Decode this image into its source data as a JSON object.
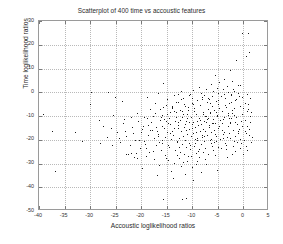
{
  "chart_data": {
    "type": "scatter",
    "title": "Scatterplot of 400 time vs accoustic features",
    "xlabel": "Accoustic loglikelihood ratios",
    "ylabel": "Time loglikelihood ratios",
    "xlim": [
      -40,
      5
    ],
    "ylim": [
      -50,
      30
    ],
    "xticks": [
      -40,
      -35,
      -30,
      -25,
      -20,
      -15,
      -10,
      -5,
      0,
      5
    ],
    "xtick_labels": [
      "-40",
      "-35",
      "-30",
      "-25",
      "-20",
      "-15",
      "-10",
      "-5",
      "0",
      "5"
    ],
    "yticks": [
      -50,
      -40,
      -30,
      -20,
      -10,
      0,
      10,
      20,
      30
    ],
    "ytick_labels": [
      "-50",
      "-40",
      "-30",
      "-20",
      "-10",
      "0",
      "10",
      "20",
      "30"
    ],
    "grid": true,
    "legend": null,
    "marker": "dot",
    "marker_color": "#1a1a1a",
    "n_points": 400,
    "points": [
      [
        -0.3,
        24.8
      ],
      [
        0.9,
        24.9
      ],
      [
        1.1,
        16.8
      ],
      [
        0.5,
        15.1
      ],
      [
        -1.4,
        13.4
      ],
      [
        -2.6,
        9.2
      ],
      [
        -5.6,
        7.4
      ],
      [
        -3.9,
        5.6
      ],
      [
        -2.3,
        4.9
      ],
      [
        -4.7,
        4.2
      ],
      [
        -15.8,
        4.1
      ],
      [
        -6.3,
        3.3
      ],
      [
        -1.0,
        3.2
      ],
      [
        -0.6,
        2.9
      ],
      [
        -3.3,
        2.6
      ],
      [
        -8.7,
        2.1
      ],
      [
        -5.2,
        1.9
      ],
      [
        -2.0,
        1.6
      ],
      [
        -7.4,
        1.4
      ],
      [
        -4.1,
        1.2
      ],
      [
        -9.8,
        0.9
      ],
      [
        -1.8,
        0.7
      ],
      [
        -6.0,
        0.5
      ],
      [
        -12.3,
        0.4
      ],
      [
        -3.0,
        0.2
      ],
      [
        -26.5,
        0.1
      ],
      [
        -16.8,
        -0.2
      ],
      [
        -5.0,
        -0.4
      ],
      [
        -10.5,
        -0.6
      ],
      [
        -2.5,
        -0.8
      ],
      [
        -7.8,
        -1.0
      ],
      [
        -13.5,
        -1.2
      ],
      [
        -4.4,
        -1.5
      ],
      [
        -0.9,
        -1.7
      ],
      [
        -18.9,
        -1.9
      ],
      [
        -8.2,
        -2.1
      ],
      [
        -11.8,
        -2.3
      ],
      [
        -3.6,
        -2.5
      ],
      [
        -6.7,
        -2.8
      ],
      [
        -14.9,
        -3.0
      ],
      [
        -9.1,
        -3.2
      ],
      [
        -1.6,
        -3.4
      ],
      [
        -5.4,
        -3.6
      ],
      [
        -12.8,
        -3.9
      ],
      [
        -7.1,
        -4.1
      ],
      [
        -17.3,
        -4.3
      ],
      [
        -10.1,
        -4.5
      ],
      [
        -2.8,
        -4.7
      ],
      [
        -4.9,
        -5.0
      ],
      [
        -15.2,
        -5.2
      ],
      [
        -8.5,
        -5.4
      ],
      [
        -6.2,
        -5.6
      ],
      [
        -11.5,
        -5.8
      ],
      [
        -3.4,
        -6.1
      ],
      [
        -13.9,
        -6.3
      ],
      [
        -9.6,
        -6.5
      ],
      [
        -1.9,
        -6.7
      ],
      [
        -7.0,
        -6.9
      ],
      [
        -16.4,
        -7.1
      ],
      [
        -5.7,
        -7.4
      ],
      [
        -10.8,
        -7.6
      ],
      [
        -12.1,
        -7.8
      ],
      [
        -4.2,
        -8.0
      ],
      [
        -8.0,
        -8.2
      ],
      [
        -14.3,
        -8.5
      ],
      [
        -6.5,
        -8.7
      ],
      [
        -2.2,
        -8.9
      ],
      [
        -9.3,
        -9.1
      ],
      [
        -11.0,
        -9.3
      ],
      [
        -5.1,
        -9.5
      ],
      [
        -17.8,
        -9.8
      ],
      [
        -7.6,
        -10.0
      ],
      [
        -13.2,
        -10.2
      ],
      [
        -3.8,
        -10.4
      ],
      [
        -10.3,
        -10.6
      ],
      [
        -8.8,
        -10.8
      ],
      [
        -15.6,
        -11.1
      ],
      [
        -6.0,
        -11.3
      ],
      [
        -12.5,
        -11.5
      ],
      [
        -4.6,
        -11.7
      ],
      [
        -9.0,
        -11.9
      ],
      [
        -11.3,
        -12.1
      ],
      [
        -7.3,
        -12.4
      ],
      [
        -2.7,
        -12.6
      ],
      [
        -14.7,
        -12.8
      ],
      [
        -5.5,
        -13.0
      ],
      [
        -10.0,
        -13.2
      ],
      [
        -8.3,
        -13.4
      ],
      [
        -12.9,
        -13.7
      ],
      [
        -6.8,
        -13.9
      ],
      [
        -3.1,
        -14.1
      ],
      [
        -16.0,
        -14.3
      ],
      [
        -9.5,
        -14.5
      ],
      [
        -11.7,
        -14.7
      ],
      [
        -5.0,
        -15.0
      ],
      [
        -13.6,
        -15.2
      ],
      [
        -7.9,
        -15.4
      ],
      [
        -10.6,
        -15.6
      ],
      [
        -4.3,
        -15.8
      ],
      [
        -18.2,
        -16.0
      ],
      [
        -8.6,
        -16.3
      ],
      [
        -12.2,
        -16.5
      ],
      [
        -6.4,
        -16.7
      ],
      [
        -15.0,
        -16.9
      ],
      [
        -9.9,
        -17.1
      ],
      [
        -2.9,
        -17.3
      ],
      [
        -11.1,
        -17.6
      ],
      [
        -7.2,
        -17.8
      ],
      [
        -13.8,
        -18.0
      ],
      [
        -5.3,
        -18.2
      ],
      [
        -10.2,
        -18.4
      ],
      [
        -16.7,
        -18.6
      ],
      [
        -8.1,
        -18.9
      ],
      [
        -12.6,
        -19.1
      ],
      [
        -4.0,
        -19.3
      ],
      [
        -9.4,
        -19.5
      ],
      [
        -14.1,
        -19.7
      ],
      [
        -6.6,
        -19.9
      ],
      [
        -11.4,
        -20.2
      ],
      [
        -19.5,
        -20.4
      ],
      [
        -7.7,
        -20.6
      ],
      [
        -13.0,
        -20.8
      ],
      [
        -5.8,
        -21.0
      ],
      [
        -10.7,
        -21.2
      ],
      [
        -15.9,
        -21.5
      ],
      [
        -8.4,
        -21.7
      ],
      [
        -12.0,
        -21.9
      ],
      [
        -3.5,
        -22.1
      ],
      [
        -17.1,
        -22.3
      ],
      [
        -9.7,
        -22.6
      ],
      [
        -6.1,
        -22.8
      ],
      [
        -14.5,
        -23.0
      ],
      [
        -11.2,
        -23.2
      ],
      [
        -7.5,
        -23.4
      ],
      [
        -20.3,
        -23.6
      ],
      [
        -10.4,
        -23.9
      ],
      [
        -13.4,
        -24.1
      ],
      [
        -5.9,
        -24.3
      ],
      [
        -16.2,
        -24.5
      ],
      [
        -8.9,
        -24.7
      ],
      [
        -12.4,
        -25.0
      ],
      [
        -18.5,
        -25.2
      ],
      [
        -9.2,
        -25.4
      ],
      [
        -22.1,
        -25.6
      ],
      [
        -11.6,
        -25.8
      ],
      [
        -6.9,
        -26.0
      ],
      [
        -15.4,
        -26.3
      ],
      [
        -13.1,
        -26.5
      ],
      [
        -19.0,
        -26.7
      ],
      [
        -10.9,
        -26.9
      ],
      [
        -8.7,
        -27.1
      ],
      [
        -21.4,
        -27.4
      ],
      [
        -12.7,
        -27.6
      ],
      [
        -17.6,
        -28.0
      ],
      [
        -14.8,
        -28.4
      ],
      [
        -9.0,
        -28.8
      ],
      [
        -11.9,
        -29.2
      ],
      [
        -23.0,
        -25.9
      ],
      [
        -22.6,
        -26.1
      ],
      [
        -7.4,
        -30.1
      ],
      [
        -16.5,
        -30.6
      ],
      [
        -12.3,
        -31.0
      ],
      [
        -10.0,
        -31.4
      ],
      [
        -19.8,
        -31.8
      ],
      [
        -36.9,
        -33.2
      ],
      [
        -5.2,
        -32.6
      ],
      [
        -14.2,
        -33.0
      ],
      [
        -8.3,
        -33.5
      ],
      [
        -11.4,
        -34.2
      ],
      [
        -17.0,
        -35.0
      ],
      [
        -13.7,
        -36.2
      ],
      [
        -9.8,
        -37.0
      ],
      [
        -15.7,
        -44.8
      ],
      [
        -12.0,
        -45.0
      ],
      [
        -11.2,
        -44.6
      ],
      [
        -1.2,
        -13.5
      ],
      [
        -0.5,
        -12.0
      ],
      [
        -0.8,
        -15.5
      ],
      [
        -1.5,
        -10.5
      ],
      [
        -0.2,
        -9.0
      ],
      [
        -2.4,
        -11.0
      ],
      [
        -1.1,
        -17.0
      ],
      [
        -0.7,
        -19.5
      ],
      [
        -1.9,
        -20.5
      ],
      [
        -0.4,
        -21.5
      ],
      [
        0.3,
        -11.5
      ],
      [
        0.7,
        -14.0
      ],
      [
        1.2,
        -12.5
      ],
      [
        0.2,
        -16.5
      ],
      [
        1.0,
        -18.0
      ],
      [
        1.6,
        -19.0
      ],
      [
        0.6,
        -8.0
      ],
      [
        1.3,
        -10.0
      ],
      [
        -0.1,
        -6.5
      ],
      [
        0.8,
        -5.0
      ],
      [
        -39.2,
        -9.1
      ],
      [
        -37.5,
        -16.2
      ],
      [
        -30.1,
        -4.8
      ],
      [
        -29.8,
        0.0
      ],
      [
        -28.2,
        -11.5
      ],
      [
        -26.0,
        -14.9
      ],
      [
        -24.8,
        -16.8
      ],
      [
        -24.1,
        -20.9
      ],
      [
        -23.5,
        -13.1
      ],
      [
        -22.9,
        -18.4
      ],
      [
        -21.7,
        -17.2
      ],
      [
        -21.0,
        -25.4
      ],
      [
        -20.5,
        -19.9
      ],
      [
        -19.9,
        -15.3
      ],
      [
        -19.3,
        -21.6
      ],
      [
        -18.7,
        -13.8
      ],
      [
        -18.0,
        -12.4
      ],
      [
        -17.5,
        -19.2
      ],
      [
        -16.9,
        -16.1
      ],
      [
        -16.3,
        -11.7
      ],
      [
        -25.2,
        -1.9
      ],
      [
        -23.8,
        -3.6
      ],
      [
        -20.8,
        -8.6
      ],
      [
        -19.4,
        -10.4
      ],
      [
        -18.3,
        -7.2
      ],
      [
        -17.2,
        -14.6
      ],
      [
        -16.6,
        -21.0
      ],
      [
        -15.9,
        -9.4
      ],
      [
        -15.3,
        -18.7
      ],
      [
        -14.6,
        -10.9
      ],
      [
        -14.0,
        -16.4
      ],
      [
        -13.3,
        -8.4
      ],
      [
        -4.8,
        -14.2
      ],
      [
        -3.9,
        -16.8
      ],
      [
        -3.2,
        -18.9
      ],
      [
        -2.6,
        -13.0
      ],
      [
        -2.1,
        -15.7
      ],
      [
        -1.7,
        -18.3
      ],
      [
        -4.5,
        -19.6
      ],
      [
        -3.7,
        -21.2
      ],
      [
        -5.6,
        -17.5
      ],
      [
        -6.3,
        -19.8
      ],
      [
        -2.3,
        -7.5
      ],
      [
        -3.0,
        -9.6
      ],
      [
        -4.1,
        -11.2
      ],
      [
        -5.9,
        -12.9
      ],
      [
        -6.7,
        -14.8
      ],
      [
        -7.5,
        -16.2
      ],
      [
        -8.2,
        -17.9
      ],
      [
        -9.1,
        -20.1
      ],
      [
        -10.5,
        -22.2
      ],
      [
        -11.8,
        -9.0
      ],
      [
        -12.5,
        -7.3
      ],
      [
        -13.9,
        -5.9
      ],
      [
        -10.9,
        -6.2
      ],
      [
        -9.6,
        -7.8
      ],
      [
        -8.0,
        -9.2
      ],
      [
        -6.9,
        -10.7
      ],
      [
        -5.4,
        -8.3
      ],
      [
        -4.7,
        -6.6
      ],
      [
        -7.8,
        -12.2
      ],
      [
        -8.9,
        -13.6
      ],
      [
        -10.1,
        -15.1
      ],
      [
        -11.5,
        -13.3
      ],
      [
        -12.8,
        -14.9
      ],
      [
        -7.1,
        -11.4
      ],
      [
        -6.2,
        -13.1
      ],
      [
        -5.1,
        -10.1
      ],
      [
        -9.3,
        -16.6
      ],
      [
        -10.7,
        -12.7
      ],
      [
        -11.0,
        -11.0
      ],
      [
        -12.1,
        -10.2
      ],
      [
        -13.4,
        -11.9
      ],
      [
        -8.5,
        -11.6
      ],
      [
        -7.3,
        -9.8
      ],
      [
        -6.5,
        -8.1
      ],
      [
        -9.8,
        -12.5
      ],
      [
        -11.3,
        -16.0
      ],
      [
        -12.9,
        -12.3
      ],
      [
        -14.4,
        -13.5
      ],
      [
        -15.1,
        -12.1
      ],
      [
        -16.1,
        -10.6
      ],
      [
        -14.9,
        -9.1
      ],
      [
        -13.6,
        -7.7
      ],
      [
        -15.5,
        -15.0
      ],
      [
        -16.8,
        -17.4
      ],
      [
        -17.9,
        -15.8
      ],
      [
        -18.6,
        -18.1
      ],
      [
        -19.7,
        -14.1
      ],
      [
        -20.1,
        -16.7
      ],
      [
        -21.3,
        -20.2
      ],
      [
        -22.3,
        -22.4
      ],
      [
        -23.2,
        -16.3
      ],
      [
        -24.4,
        -19.1
      ],
      [
        -25.8,
        -22.0
      ],
      [
        -2.0,
        -22.6
      ],
      [
        -1.3,
        -20.8
      ],
      [
        -0.6,
        -23.4
      ],
      [
        0.1,
        -20.0
      ],
      [
        0.5,
        -22.8
      ],
      [
        1.4,
        -21.0
      ],
      [
        -3.4,
        -24.0
      ],
      [
        -4.9,
        -22.9
      ],
      [
        -6.0,
        -24.5
      ],
      [
        -7.9,
        -25.3
      ],
      [
        -9.4,
        -21.3
      ],
      [
        -2.7,
        -19.4
      ],
      [
        -1.0,
        -16.1
      ],
      [
        0.4,
        -17.2
      ],
      [
        1.1,
        -15.3
      ],
      [
        -0.3,
        -14.1
      ],
      [
        -1.6,
        -12.3
      ],
      [
        -2.9,
        -10.9
      ],
      [
        -4.3,
        -12.8
      ],
      [
        -5.7,
        -15.9
      ],
      [
        -3.6,
        -5.3
      ],
      [
        -2.4,
        -4.1
      ],
      [
        -1.4,
        -2.9
      ],
      [
        -0.7,
        -5.7
      ],
      [
        0.2,
        -4.3
      ],
      [
        0.9,
        -6.9
      ],
      [
        1.5,
        -8.4
      ],
      [
        -5.0,
        -3.1
      ],
      [
        -6.6,
        -4.6
      ],
      [
        -8.1,
        -3.0
      ],
      [
        -9.9,
        -4.9
      ],
      [
        -11.6,
        -5.1
      ],
      [
        -13.2,
        -4.0
      ],
      [
        -7.0,
        -2.2
      ],
      [
        -10.0,
        -2.6
      ],
      [
        -12.2,
        -2.9
      ],
      [
        -14.0,
        -6.8
      ],
      [
        -15.8,
        -6.0
      ],
      [
        -17.4,
        -8.9
      ],
      [
        -18.9,
        -11.0
      ],
      [
        -20.6,
        -12.0
      ],
      [
        -21.9,
        -14.4
      ],
      [
        -23.4,
        -11.4
      ],
      [
        -26.8,
        -18.9
      ],
      [
        -28.0,
        -21.5
      ],
      [
        -31.5,
        -20.7
      ],
      [
        -33.0,
        -16.9
      ],
      [
        -27.4,
        -14.2
      ],
      [
        -25.5,
        -9.7
      ],
      [
        -22.0,
        -10.5
      ],
      [
        -2.2,
        -25.8
      ],
      [
        -3.3,
        -27.3
      ],
      [
        -5.5,
        -26.4
      ],
      [
        -7.6,
        -28.1
      ],
      [
        -10.3,
        -27.0
      ],
      [
        -12.6,
        -23.1
      ],
      [
        -14.7,
        -22.0
      ],
      [
        -8.8,
        -23.8
      ],
      [
        -6.4,
        -21.4
      ],
      [
        -4.4,
        -23.5
      ],
      [
        -1.7,
        -24.9
      ],
      [
        0.0,
        -26.0
      ],
      [
        0.7,
        -24.2
      ],
      [
        -9.2,
        -30.0
      ],
      [
        -11.0,
        -29.0
      ],
      [
        -13.5,
        -29.8
      ],
      [
        -15.2,
        -27.5
      ],
      [
        -17.8,
        -24.8
      ],
      [
        -19.1,
        -23.3
      ],
      [
        -20.9,
        -27.8
      ],
      [
        -2.5,
        -1.2
      ],
      [
        -1.1,
        -0.3
      ],
      [
        -0.2,
        -1.8
      ],
      [
        0.6,
        -0.9
      ],
      [
        1.3,
        -2.4
      ],
      [
        -3.8,
        -0.7
      ],
      [
        -6.1,
        -1.4
      ],
      [
        -8.4,
        -0.5
      ],
      [
        -10.6,
        -1.1
      ],
      [
        -12.9,
        -0.8
      ],
      [
        -4.0,
        -17.6
      ],
      [
        -5.3,
        -20.3
      ],
      [
        -7.7,
        -18.5
      ],
      [
        -9.0,
        -19.1
      ],
      [
        -11.9,
        -18.2
      ],
      [
        -13.0,
        -20.6
      ],
      [
        -14.3,
        -17.0
      ],
      [
        -16.0,
        -20.0
      ],
      [
        -1.8,
        -9.5
      ],
      [
        -3.1,
        -8.7
      ]
    ]
  }
}
